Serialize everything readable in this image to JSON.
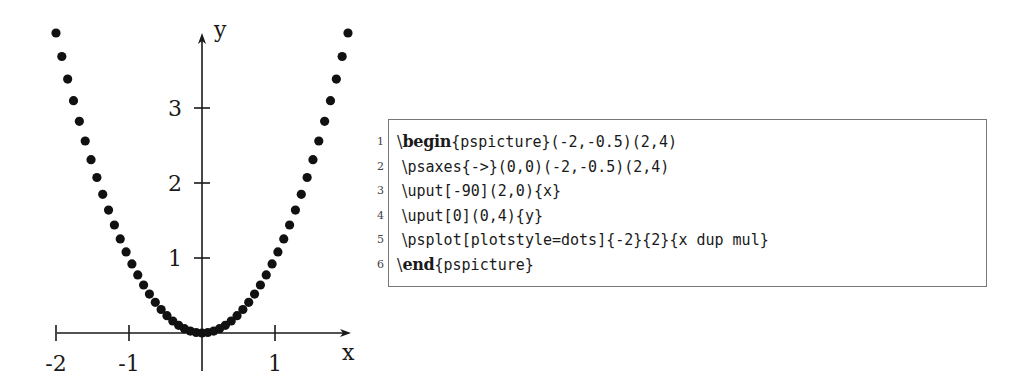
{
  "chart_data": {
    "type": "scatter",
    "plotstyle": "dots",
    "title": "",
    "function": "y = x^2",
    "xlabel": "x",
    "ylabel": "y",
    "xlim": [
      -2,
      2
    ],
    "ylim": [
      -0.5,
      4
    ],
    "x_ticks": [
      -2,
      -1,
      1
    ],
    "x_tick_labels": [
      "-2",
      "-1",
      "1"
    ],
    "y_ticks": [
      1,
      2,
      3
    ],
    "y_tick_labels": [
      "1",
      "2",
      "3"
    ],
    "grid": false,
    "legend": null,
    "n_points": 51,
    "x": [
      -2.0,
      -1.92,
      -1.84,
      -1.76,
      -1.68,
      -1.6,
      -1.52,
      -1.44,
      -1.36,
      -1.28,
      -1.2,
      -1.12,
      -1.04,
      -0.96,
      -0.88,
      -0.8,
      -0.72,
      -0.64,
      -0.56,
      -0.48,
      -0.4,
      -0.32,
      -0.24,
      -0.16,
      -0.08,
      0.0,
      0.08,
      0.16,
      0.24,
      0.32,
      0.4,
      0.48,
      0.56,
      0.64,
      0.72,
      0.8,
      0.88,
      0.96,
      1.04,
      1.12,
      1.2,
      1.28,
      1.36,
      1.44,
      1.52,
      1.6,
      1.68,
      1.76,
      1.84,
      1.92,
      2.0
    ],
    "values": [
      4.0,
      3.6864,
      3.3856,
      3.0976,
      2.8224,
      2.56,
      2.3104,
      2.0736,
      1.8496,
      1.6384,
      1.44,
      1.2544,
      1.0816,
      0.9216,
      0.7744,
      0.64,
      0.5184,
      0.4096,
      0.3136,
      0.2304,
      0.16,
      0.1024,
      0.0576,
      0.0256,
      0.0064,
      0.0,
      0.0064,
      0.0256,
      0.0576,
      0.1024,
      0.16,
      0.2304,
      0.3136,
      0.4096,
      0.5184,
      0.64,
      0.7744,
      0.9216,
      1.0816,
      1.2544,
      1.44,
      1.6384,
      1.8496,
      2.0736,
      2.3104,
      2.56,
      2.8224,
      3.0976,
      3.3856,
      3.6864,
      4.0
    ]
  },
  "code_listing": {
    "lines": [
      {
        "number": "1",
        "keyword_prefix": "\\",
        "keyword": "begin",
        "rest": "{pspicture}(-2,-0.5)(2,4)"
      },
      {
        "number": "2",
        "keyword_prefix": " \\",
        "keyword": "",
        "rest": "psaxes{->}(0,0)(-2,-0.5)(2,4)"
      },
      {
        "number": "3",
        "keyword_prefix": " \\",
        "keyword": "",
        "rest": "uput[-90](2,0){x}"
      },
      {
        "number": "4",
        "keyword_prefix": " \\",
        "keyword": "",
        "rest": "uput[0](0,4){y}"
      },
      {
        "number": "5",
        "keyword_prefix": " \\",
        "keyword": "",
        "rest": "psplot[plotstyle=dots]{-2}{2}{x dup mul}"
      },
      {
        "number": "6",
        "keyword_prefix": "\\",
        "keyword": "end",
        "rest": "{pspicture}"
      }
    ]
  }
}
